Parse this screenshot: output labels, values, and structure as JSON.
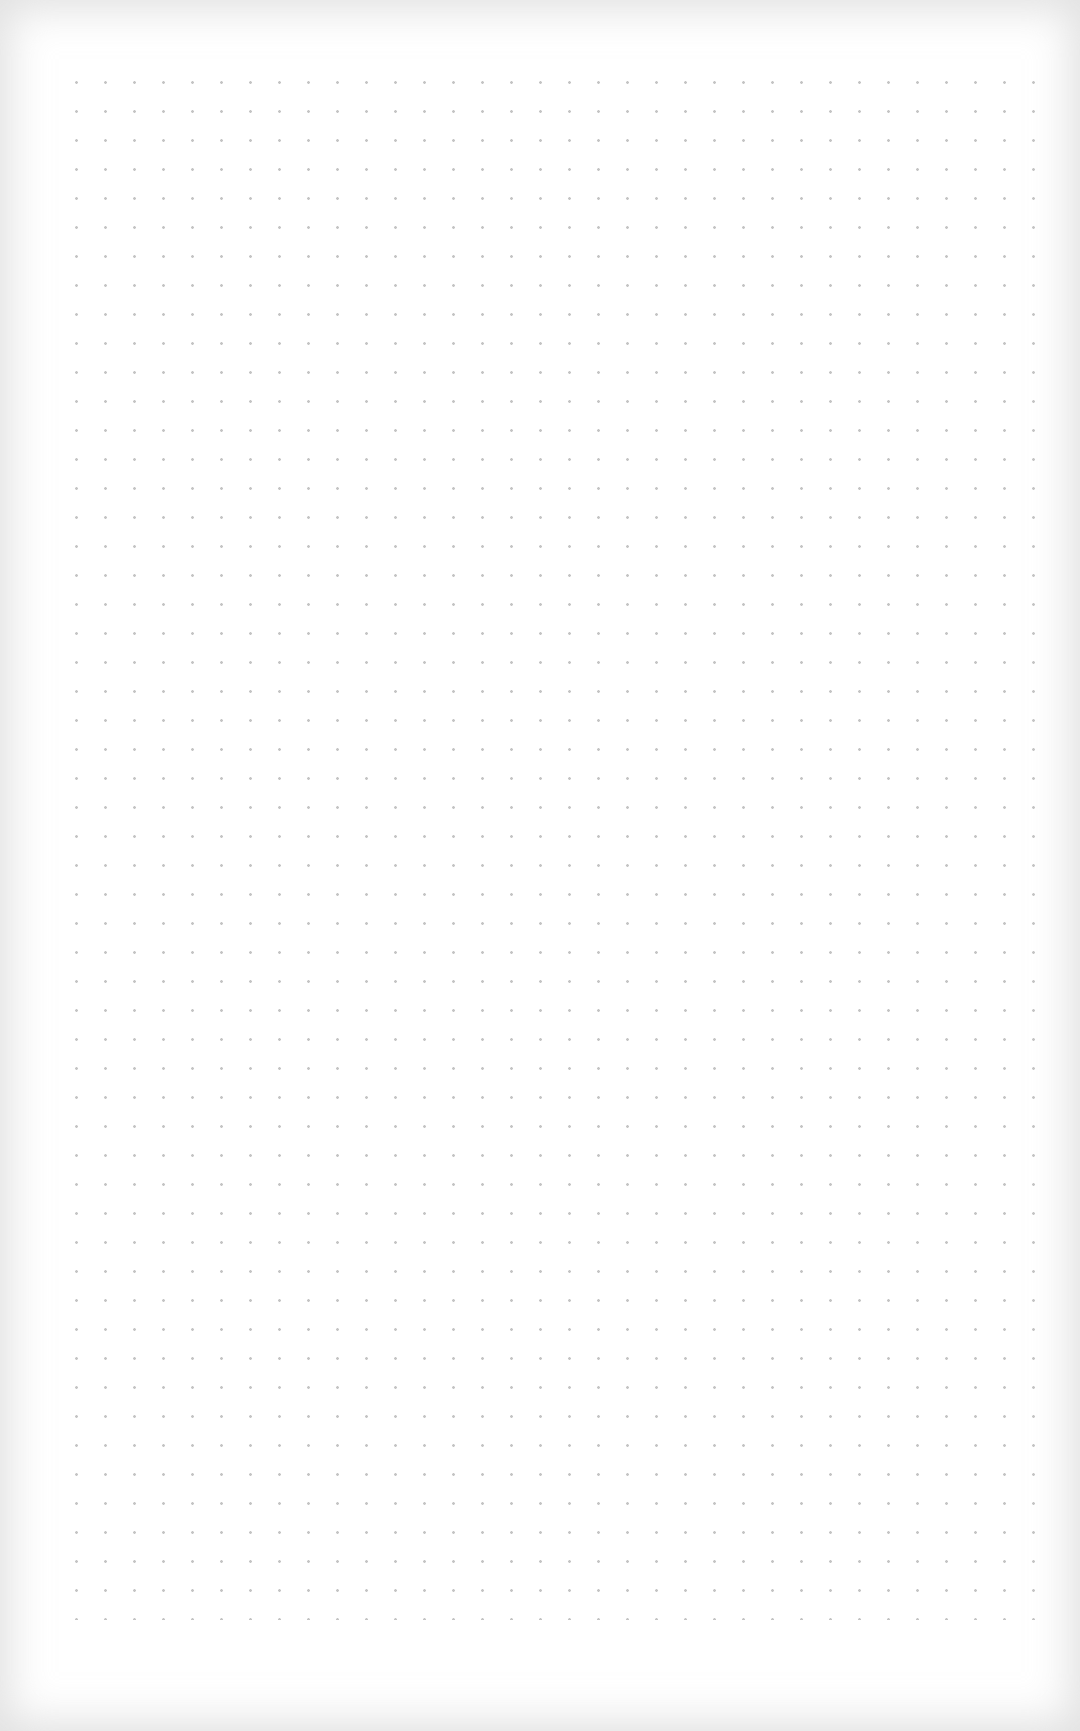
{
  "page": {
    "type": "dot-grid-paper",
    "description": "Blank dot grid notebook page",
    "background_color": "#ffffff",
    "dot_color": "#c4c4c4",
    "dot_spacing_px": 29,
    "edge_shade_color": "#d0d0d0"
  }
}
